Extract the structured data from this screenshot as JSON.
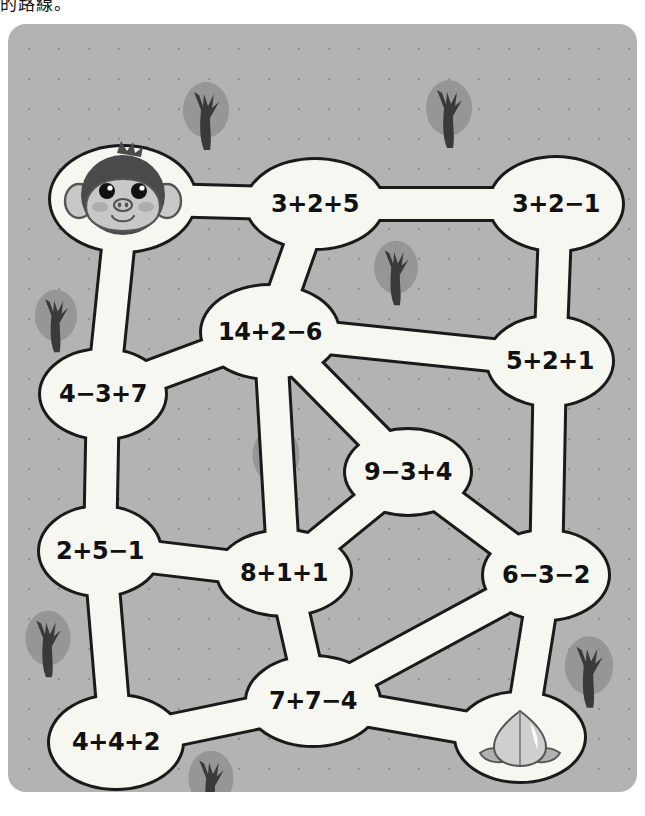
{
  "caption": "的路線。",
  "colors": {
    "board_bg": "#b3b3b3",
    "dot": "#8f8f8f",
    "path_fill": "#f7f7f2",
    "path_stroke": "#1a1a1a",
    "tree_canopy": "#8c8c8c",
    "tree_trunk": "#3a3a3a",
    "monkey_hair": "#4a4a4a",
    "monkey_face": "#c8c8c8",
    "cheek": "#a8a8a8",
    "peach_body": "#cfcfcf",
    "peach_leaf": "#b0b0b0"
  },
  "board": {
    "start_icon": "monkey-face-icon",
    "goal_icon": "peach-icon",
    "decor_icon": "tree-icon",
    "nodes": [
      {
        "id": "start",
        "label": "",
        "x": 115,
        "y": 175,
        "rx": 72,
        "ry": 52,
        "kind": "start"
      },
      {
        "id": "n325",
        "label": "3+2+5",
        "x": 307,
        "y": 180,
        "rx": 68,
        "ry": 44,
        "kind": "math"
      },
      {
        "id": "n321",
        "label": "3+2−1",
        "x": 548,
        "y": 180,
        "rx": 66,
        "ry": 46,
        "kind": "math"
      },
      {
        "id": "n1426",
        "label": "14+2−6",
        "x": 262,
        "y": 308,
        "rx": 68,
        "ry": 46,
        "kind": "math"
      },
      {
        "id": "n521",
        "label": "5+2+1",
        "x": 542,
        "y": 337,
        "rx": 62,
        "ry": 44,
        "kind": "math"
      },
      {
        "id": "n437",
        "label": "4−3+7",
        "x": 95,
        "y": 370,
        "rx": 62,
        "ry": 44,
        "kind": "math"
      },
      {
        "id": "n934",
        "label": "9−3+4",
        "x": 400,
        "y": 448,
        "rx": 62,
        "ry": 42,
        "kind": "math"
      },
      {
        "id": "n251",
        "label": "2+5−1",
        "x": 92,
        "y": 527,
        "rx": 60,
        "ry": 44,
        "kind": "math"
      },
      {
        "id": "n811",
        "label": "8+1+1",
        "x": 276,
        "y": 549,
        "rx": 66,
        "ry": 42,
        "kind": "math"
      },
      {
        "id": "n632",
        "label": "6−3−2",
        "x": 538,
        "y": 551,
        "rx": 62,
        "ry": 44,
        "kind": "math"
      },
      {
        "id": "n774",
        "label": "7+7−4",
        "x": 305,
        "y": 677,
        "rx": 66,
        "ry": 44,
        "kind": "math"
      },
      {
        "id": "n442",
        "label": "4+4+2",
        "x": 108,
        "y": 718,
        "rx": 66,
        "ry": 46,
        "kind": "math"
      },
      {
        "id": "goal",
        "label": "",
        "x": 512,
        "y": 713,
        "rx": 64,
        "ry": 44,
        "kind": "goal"
      }
    ],
    "edges": [
      {
        "from": "start",
        "to": "n325"
      },
      {
        "from": "n325",
        "to": "n321"
      },
      {
        "from": "n325",
        "to": "n1426"
      },
      {
        "from": "n321",
        "to": "n521"
      },
      {
        "from": "start",
        "to": "n437"
      },
      {
        "from": "n437",
        "to": "n1426"
      },
      {
        "from": "n1426",
        "to": "n521"
      },
      {
        "from": "n1426",
        "to": "n934"
      },
      {
        "from": "n1426",
        "to": "n811"
      },
      {
        "from": "n521",
        "to": "n632"
      },
      {
        "from": "n934",
        "to": "n632"
      },
      {
        "from": "n437",
        "to": "n251"
      },
      {
        "from": "n811",
        "to": "n934"
      },
      {
        "from": "n251",
        "to": "n811"
      },
      {
        "from": "n251",
        "to": "n442"
      },
      {
        "from": "n811",
        "to": "n774"
      },
      {
        "from": "n774",
        "to": "n442"
      },
      {
        "from": "n774",
        "to": "n632"
      },
      {
        "from": "n774",
        "to": "goal"
      },
      {
        "from": "n632",
        "to": "goal"
      }
    ],
    "trees": [
      {
        "x": 198,
        "y": 92,
        "s": 1.0
      },
      {
        "x": 441,
        "y": 90,
        "s": 1.0
      },
      {
        "x": 388,
        "y": 249,
        "s": 0.95
      },
      {
        "x": 48,
        "y": 297,
        "s": 0.92
      },
      {
        "x": 268,
        "y": 437,
        "s": 1.02
      },
      {
        "x": 40,
        "y": 620,
        "s": 0.98
      },
      {
        "x": 581,
        "y": 648,
        "s": 1.05
      },
      {
        "x": 203,
        "y": 760,
        "s": 0.98
      }
    ]
  }
}
